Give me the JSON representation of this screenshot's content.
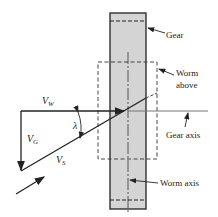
{
  "diagram": {
    "labels": {
      "gear": "Gear",
      "worm_above_line1": "Worm",
      "worm_above_line2": "above",
      "gear_axis": "Gear axis",
      "worm_axis": "Worm axis",
      "lambda": "λ"
    },
    "vectors": {
      "vw": {
        "main": "V",
        "sub": "W"
      },
      "vg": {
        "main": "V",
        "sub": "G"
      },
      "vs": {
        "main": "V",
        "sub": "S"
      }
    },
    "colors": {
      "gear_fill": "#d4d4d4",
      "line": "#222222",
      "axis_line": "#888888"
    }
  }
}
